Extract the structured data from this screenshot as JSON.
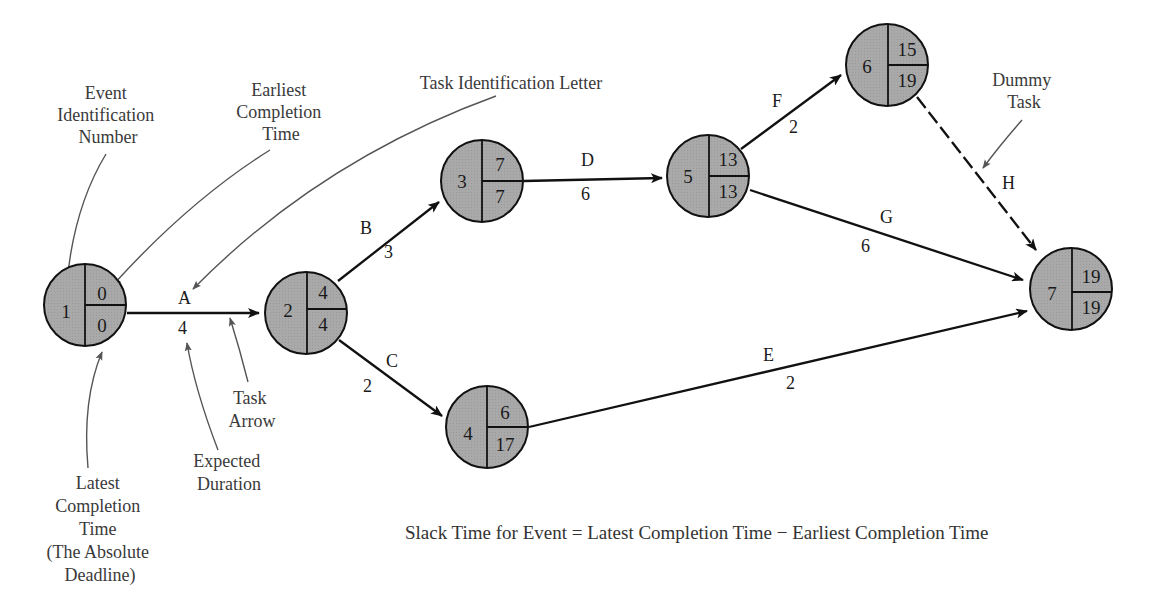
{
  "diagram": {
    "type": "PERT network",
    "colors": {
      "node_fill": "#a9a9a9",
      "stroke": "#111111",
      "callout_stroke": "#555555",
      "text": "#222222"
    },
    "nodes": [
      {
        "id": "1",
        "earliest": "0",
        "latest": "0",
        "cx": 85,
        "cy": 305
      },
      {
        "id": "2",
        "earliest": "4",
        "latest": "4",
        "cx": 306,
        "cy": 313
      },
      {
        "id": "3",
        "earliest": "7",
        "latest": "7",
        "cx": 482,
        "cy": 181
      },
      {
        "id": "4",
        "earliest": "6",
        "latest": "17",
        "cx": 487,
        "cy": 427
      },
      {
        "id": "5",
        "earliest": "13",
        "latest": "13",
        "cx": 708,
        "cy": 176
      },
      {
        "id": "6",
        "earliest": "15",
        "latest": "19",
        "cx": 887,
        "cy": 65
      },
      {
        "id": "7",
        "earliest": "19",
        "latest": "19",
        "cx": 1071,
        "cy": 289
      }
    ],
    "tasks": [
      {
        "letter": "A",
        "duration": "4",
        "from": "1",
        "to": "2",
        "dashed": false
      },
      {
        "letter": "B",
        "duration": "3",
        "from": "2",
        "to": "3",
        "dashed": false
      },
      {
        "letter": "C",
        "duration": "2",
        "from": "2",
        "to": "4",
        "dashed": false
      },
      {
        "letter": "D",
        "duration": "6",
        "from": "3",
        "to": "5",
        "dashed": false
      },
      {
        "letter": "E",
        "duration": "2",
        "from": "4",
        "to": "7",
        "dashed": false
      },
      {
        "letter": "F",
        "duration": "2",
        "from": "5",
        "to": "6",
        "dashed": false
      },
      {
        "letter": "G",
        "duration": "6",
        "from": "5",
        "to": "7",
        "dashed": false
      },
      {
        "letter": "H",
        "duration": "",
        "from": "6",
        "to": "7",
        "dashed": true
      }
    ],
    "callouts": {
      "event_id": [
        "Event",
        "Identification",
        "Number"
      ],
      "earliest": [
        "Earliest",
        "Completion",
        "Time"
      ],
      "task_letter": [
        "Task Identification Letter"
      ],
      "latest": [
        "Latest",
        "Completion",
        "Time",
        "(The Absolute",
        "Deadline)"
      ],
      "expected_duration": [
        "Expected",
        "Duration"
      ],
      "task_arrow": [
        "Task",
        "Arrow"
      ],
      "dummy_task": [
        "Dummy",
        "Task"
      ]
    },
    "formula": "Slack Time for Event = Latest Completion Time − Earliest Completion Time"
  }
}
